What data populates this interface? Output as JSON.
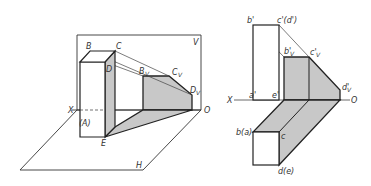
{
  "figure": {
    "left_view": {
      "title": "Perspective view of prism shadow on projection planes",
      "labels": {
        "B": "B",
        "C": "C",
        "D": "D",
        "A": "(A)",
        "E": "E",
        "Bv": "B",
        "Bv_sub": "V",
        "Cv": "C",
        "Cv_sub": "V",
        "Dv": "D",
        "Dv_sub": "V",
        "V": "V",
        "H": "H",
        "X": "X",
        "O": "O"
      }
    },
    "right_view": {
      "title": "Orthographic projection of prism shadow",
      "labels": {
        "b_prime": "b'",
        "c_prime_d_prime": "c'(d')",
        "bv_prime": "b'",
        "bv_sub": "V",
        "cv_prime": "c'",
        "cv_sub": "V",
        "dv_prime": "d'",
        "dv_sub": "V",
        "a_prime": "a'",
        "e_prime": "e'",
        "X": "X",
        "O": "O",
        "b_a": "b(a)",
        "c": "c",
        "d_e": "d(e)"
      }
    },
    "colors": {
      "line": "#222222",
      "shadow": "#c8c8c8",
      "thin_line": "#444444"
    }
  }
}
